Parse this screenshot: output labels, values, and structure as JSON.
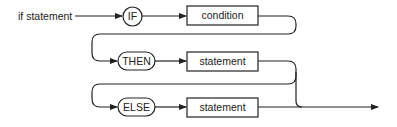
{
  "diagram": {
    "type": "syntax-diagram",
    "entry_label": "if statement",
    "nodes": [
      {
        "id": "if",
        "kind": "terminal",
        "label": "IF"
      },
      {
        "id": "cond",
        "kind": "nonterminal",
        "label": "condition"
      },
      {
        "id": "then",
        "kind": "terminal",
        "label": "THEN"
      },
      {
        "id": "stmt1",
        "kind": "nonterminal",
        "label": "statement"
      },
      {
        "id": "else",
        "kind": "terminal",
        "label": "ELSE"
      },
      {
        "id": "stmt2",
        "kind": "nonterminal",
        "label": "statement"
      }
    ],
    "colors": {
      "line": "#222222",
      "background": "#ffffff"
    }
  }
}
